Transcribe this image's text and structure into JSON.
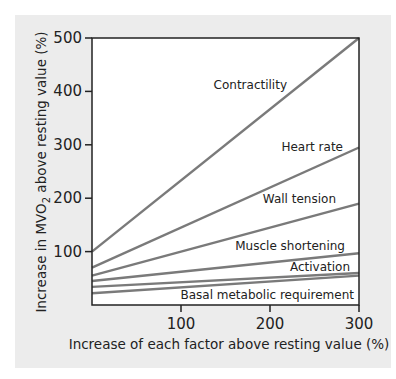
{
  "chart_data": {
    "type": "line",
    "title": "",
    "xlabel": "Increase of each factor above resting value (%)",
    "ylabel_parts": {
      "pre": "Increase in MVO",
      "sub": "2",
      "post": " above resting value (%)"
    },
    "ylabel": "Increase in MVO2 above resting value (%)",
    "xlim": [
      0,
      300
    ],
    "ylim": [
      0,
      500
    ],
    "x_ticks": [
      100,
      200,
      300
    ],
    "y_ticks": [
      100,
      200,
      300,
      400,
      500
    ],
    "grid": false,
    "legend": "inline labels",
    "x": [
      0,
      300
    ],
    "series": [
      {
        "name": "Contractility",
        "values": [
          100,
          500
        ]
      },
      {
        "name": "Heart rate",
        "values": [
          70,
          295
        ]
      },
      {
        "name": "Wall tension",
        "values": [
          55,
          190
        ]
      },
      {
        "name": "Muscle shortening",
        "values": [
          45,
          97
        ]
      },
      {
        "name": "Activation",
        "values": [
          34,
          60
        ]
      },
      {
        "name": "Basal metabolic requirement",
        "values": [
          22,
          55
        ]
      }
    ],
    "colors": {
      "line": "#7a7a7a",
      "axis": "#222222",
      "panel": "#ececec",
      "plot": "#ffffff"
    }
  }
}
